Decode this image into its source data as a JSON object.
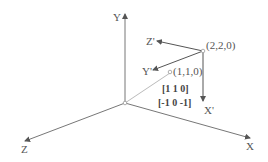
{
  "diagram": {
    "axes": {
      "y_label": "Y",
      "z_label": "Z",
      "x_label": "X"
    },
    "rotated_axes": {
      "z_prime_label": "Z'",
      "y_prime_label": "Y'",
      "x_prime_label": "X'"
    },
    "points": {
      "p1_label": "(1,1,0)",
      "p2_label": "(2,2,0)"
    },
    "vectors": {
      "v1": "[1 1 0]",
      "v2": "[-1 0 -1]"
    },
    "colors": {
      "axis": "#666666",
      "diagonal": "#bbbbbb",
      "text": "#555555"
    }
  }
}
